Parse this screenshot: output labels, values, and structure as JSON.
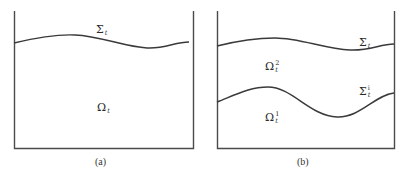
{
  "panels": [
    {
      "id": "a",
      "caption": "(a)",
      "boundary_label": {
        "symbol": "Σ",
        "sub": "t",
        "sup": ""
      },
      "domain_label": {
        "symbol": "Ω",
        "sub": "t",
        "sup": ""
      }
    },
    {
      "id": "b",
      "caption": "(b)",
      "top_boundary_label": {
        "symbol": "Σ",
        "sub": "t",
        "sup": ""
      },
      "interface_label": {
        "symbol": "Σ",
        "sub": "t",
        "sup": "i"
      },
      "upper_domain_label": {
        "symbol": "Ω",
        "sub": "t",
        "sup": "2"
      },
      "lower_domain_label": {
        "symbol": "Ω",
        "sub": "t",
        "sup": "1"
      }
    }
  ],
  "colors": {
    "line": "#3a3a3a",
    "background": "#ffffff"
  }
}
